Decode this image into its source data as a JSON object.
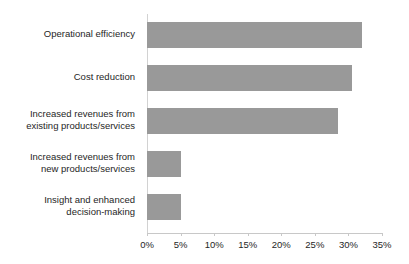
{
  "chart_data": {
    "type": "bar",
    "orientation": "horizontal",
    "title": "",
    "subtitle": "",
    "xlabel": "",
    "ylabel": "",
    "xlim": [
      0,
      35
    ],
    "grid": false,
    "legend": false,
    "bar_color": "#999999",
    "axis_color": "#c8c8c8",
    "text_color": "#262626",
    "categories": [
      "Operational efficiency",
      "Cost reduction",
      "Increased revenues from\nexisting products/services",
      "Increased revenues from\nnew products/services",
      "Insight and enhanced\ndecision-making"
    ],
    "values": [
      32,
      30.5,
      28.5,
      5,
      5
    ],
    "xticks": [
      0,
      5,
      10,
      15,
      20,
      25,
      30,
      35
    ],
    "xticklabels": [
      "0%",
      "5%",
      "10%",
      "15%",
      "20%",
      "25%",
      "30%",
      "35%"
    ]
  }
}
